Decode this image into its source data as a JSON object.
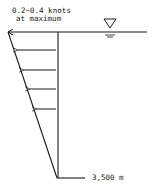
{
  "diagram": {
    "speed_label_line1": "0.2~0.4 knots",
    "speed_label_line2": "at maximum",
    "depth_label": "3,500 m",
    "water_surface_symbol": "water-level-triangle",
    "arrow_count": 5,
    "colors": {
      "line": "#1a1a1a",
      "background": "#ffffff"
    }
  }
}
